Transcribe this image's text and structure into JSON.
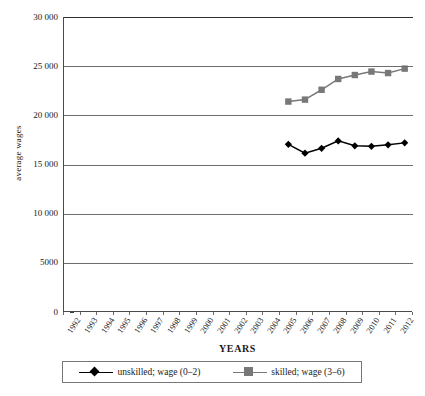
{
  "chart_data": {
    "type": "line",
    "title": "",
    "xlabel": "YEARS",
    "ylabel": "average wages",
    "ylim": [
      0,
      30000
    ],
    "ytick_labels": [
      "0",
      "5000",
      "10 000",
      "15 000",
      "20 000",
      "25 000",
      "30 000"
    ],
    "ytick_values": [
      0,
      5000,
      10000,
      15000,
      20000,
      25000,
      30000
    ],
    "grid": "horizontal",
    "legend_position": "below-axis",
    "categories": [
      "1992",
      "1993",
      "1994",
      "1995",
      "1996",
      "1997",
      "1998",
      "1999",
      "2000",
      "2001",
      "2002",
      "2003",
      "2004",
      "2005",
      "2006",
      "2007",
      "2008",
      "2009",
      "2010",
      "2011",
      "2012"
    ],
    "series": [
      {
        "name": "unskilled; wage (0–2)",
        "marker": "diamond",
        "color": "#000000",
        "values": [
          null,
          null,
          null,
          null,
          null,
          null,
          null,
          null,
          null,
          null,
          null,
          null,
          null,
          17050,
          16150,
          16650,
          17400,
          16900,
          16850,
          17000,
          17200
        ]
      },
      {
        "name": "skilled; wage (3–6)",
        "marker": "square",
        "color": "#787878",
        "values": [
          null,
          null,
          null,
          null,
          null,
          null,
          null,
          null,
          null,
          null,
          null,
          null,
          null,
          21400,
          21600,
          22600,
          23700,
          24100,
          24450,
          24300,
          24750
        ]
      }
    ]
  },
  "axes": {
    "y_title": "average wages",
    "x_title": "YEARS"
  },
  "legend": {
    "entries": [
      {
        "label": "unskilled; wage (0–2)",
        "marker": "diamond-marker-icon",
        "color": "#000000"
      },
      {
        "label": "skilled; wage (3–6)",
        "marker": "square-marker-icon",
        "color": "#787878"
      }
    ]
  },
  "colors": {
    "unskilled": "#000000",
    "skilled": "#787878",
    "axis": "#4a4a4a",
    "gridline": "#6e6e6e",
    "background": "#ffffff"
  }
}
